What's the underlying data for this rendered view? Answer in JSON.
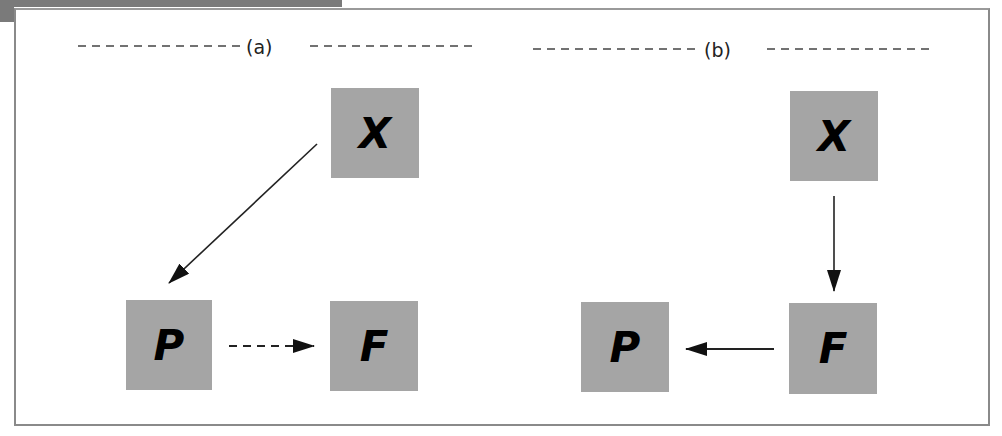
{
  "panels": [
    {
      "label": "(a)",
      "nodes": [
        {
          "id": "X",
          "label": "X"
        },
        {
          "id": "P",
          "label": "P"
        },
        {
          "id": "F",
          "label": "F"
        }
      ],
      "edges": [
        {
          "from": "X",
          "to": "P",
          "style": "solid"
        },
        {
          "from": "P",
          "to": "F",
          "style": "dashed"
        }
      ]
    },
    {
      "label": "(b)",
      "nodes": [
        {
          "id": "X",
          "label": "X"
        },
        {
          "id": "F",
          "label": "F"
        },
        {
          "id": "P",
          "label": "P"
        }
      ],
      "edges": [
        {
          "from": "X",
          "to": "F",
          "style": "solid"
        },
        {
          "from": "F",
          "to": "P",
          "style": "solid"
        }
      ]
    }
  ],
  "colors": {
    "node_fill": "#a5a5a5",
    "arrow": "#111111",
    "frame": "#8a8a8a"
  }
}
